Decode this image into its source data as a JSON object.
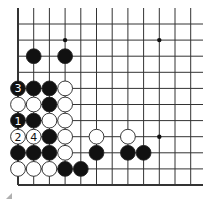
{
  "diagram": {
    "type": "go-board-fragment",
    "columns": 12,
    "rows": 11,
    "edges": [
      "left",
      "bottom"
    ],
    "grid": {
      "x0": 18,
      "dx": 15.7,
      "y0": 24,
      "dy": 16.1,
      "line_color": "#333333",
      "extend_top": 8,
      "extend_right": 203
    },
    "hoshi": [
      {
        "col": 3,
        "row": 1
      },
      {
        "col": 9,
        "row": 1
      },
      {
        "col": 9,
        "row": 7
      }
    ],
    "stones": [
      {
        "col": 1,
        "row": 2,
        "color": "black"
      },
      {
        "col": 3,
        "row": 2,
        "color": "black"
      },
      {
        "col": 0,
        "row": 4,
        "color": "black",
        "label": "3"
      },
      {
        "col": 1,
        "row": 4,
        "color": "black"
      },
      {
        "col": 2,
        "row": 4,
        "color": "black"
      },
      {
        "col": 3,
        "row": 4,
        "color": "white"
      },
      {
        "col": 0,
        "row": 5,
        "color": "white"
      },
      {
        "col": 1,
        "row": 5,
        "color": "white"
      },
      {
        "col": 2,
        "row": 5,
        "color": "black"
      },
      {
        "col": 3,
        "row": 5,
        "color": "white"
      },
      {
        "col": 0,
        "row": 6,
        "color": "black",
        "label": "1"
      },
      {
        "col": 1,
        "row": 6,
        "color": "black"
      },
      {
        "col": 2,
        "row": 6,
        "color": "white"
      },
      {
        "col": 3,
        "row": 6,
        "color": "white"
      },
      {
        "col": 0,
        "row": 7,
        "color": "white",
        "label": "2"
      },
      {
        "col": 1,
        "row": 7,
        "color": "white",
        "label": "4"
      },
      {
        "col": 2,
        "row": 7,
        "color": "black"
      },
      {
        "col": 3,
        "row": 7,
        "color": "white"
      },
      {
        "col": 5,
        "row": 7,
        "color": "white"
      },
      {
        "col": 7,
        "row": 7,
        "color": "white"
      },
      {
        "col": 0,
        "row": 8,
        "color": "black"
      },
      {
        "col": 1,
        "row": 8,
        "color": "black"
      },
      {
        "col": 2,
        "row": 8,
        "color": "black"
      },
      {
        "col": 3,
        "row": 8,
        "color": "white"
      },
      {
        "col": 5,
        "row": 8,
        "color": "black"
      },
      {
        "col": 7,
        "row": 8,
        "color": "black"
      },
      {
        "col": 8,
        "row": 8,
        "color": "black"
      },
      {
        "col": 0,
        "row": 9,
        "color": "white"
      },
      {
        "col": 1,
        "row": 9,
        "color": "white"
      },
      {
        "col": 2,
        "row": 9,
        "color": "white"
      },
      {
        "col": 3,
        "row": 9,
        "color": "black"
      },
      {
        "col": 4,
        "row": 9,
        "color": "black"
      }
    ],
    "colors": {
      "black": "#111111",
      "white": "#ffffff",
      "stone_outline": "#222222"
    }
  }
}
